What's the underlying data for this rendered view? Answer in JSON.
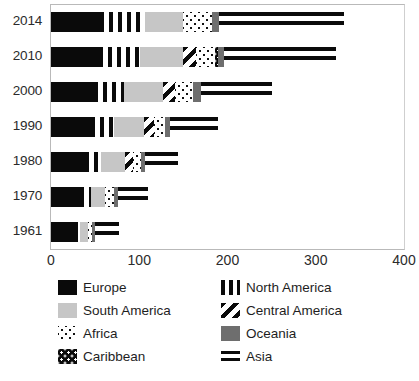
{
  "chart_data": {
    "type": "bar",
    "orientation": "horizontal",
    "stacked": true,
    "title": "",
    "xlabel": "",
    "ylabel": "",
    "xlim": [
      0,
      400
    ],
    "ylim": null,
    "grid": false,
    "legend_position": "bottom",
    "xticks": [
      "0",
      "100",
      "200",
      "300",
      "400"
    ],
    "xtick_values": [
      0,
      100,
      200,
      300,
      400
    ],
    "categories": [
      "2014",
      "2010",
      "2000",
      "1990",
      "1980",
      "1970",
      "1961"
    ],
    "series": [
      {
        "name": "Europe",
        "pattern": "solid-black",
        "color": "#0a0a0a",
        "values": [
          56,
          54,
          49,
          45,
          38,
          33,
          26
        ]
      },
      {
        "name": "North America",
        "pattern": "vertical-stripes",
        "color": "#0a0a0a",
        "values": [
          51,
          47,
          34,
          26,
          19,
          12,
          7
        ]
      },
      {
        "name": "South America",
        "pattern": "solid-lightgray",
        "color": "#c6c6c6",
        "values": [
          43,
          49,
          44,
          34,
          27,
          16,
          9
        ]
      },
      {
        "name": "Central America",
        "pattern": "diagonal-hatch",
        "color": "#0a0a0a",
        "values": [
          0,
          14,
          14,
          12,
          9,
          0,
          0
        ]
      },
      {
        "name": "Africa",
        "pattern": "dots-on-white",
        "color": "#111111",
        "values": [
          32,
          22,
          20,
          12,
          9,
          10,
          4
        ]
      },
      {
        "name": "Caribbean",
        "pattern": "dots-on-black",
        "color": "#0a0a0a",
        "values": [
          0,
          3,
          0,
          0,
          0,
          0,
          0
        ]
      },
      {
        "name": "Oceania",
        "pattern": "solid-gray",
        "color": "#6e6e6e",
        "values": [
          8,
          7,
          9,
          6,
          5,
          5,
          4
        ]
      },
      {
        "name": "Asia",
        "pattern": "horizontal-bands",
        "color": "#0a0a0a",
        "values": [
          142,
          127,
          80,
          54,
          37,
          34,
          27
        ]
      }
    ],
    "totals": [
      332,
      323,
      250,
      189,
      144,
      110,
      77
    ]
  },
  "legend": {
    "left_column": [
      {
        "label": "Europe",
        "swatch": "solid-black"
      },
      {
        "label": "South America",
        "swatch": "solid-lightgray"
      },
      {
        "label": "Africa",
        "swatch": "dots-on-white"
      },
      {
        "label": "Caribbean",
        "swatch": "dots-on-black"
      }
    ],
    "right_column": [
      {
        "label": "North America",
        "swatch": "vertical-stripes"
      },
      {
        "label": "Central America",
        "swatch": "diagonal-hatch"
      },
      {
        "label": "Oceania",
        "swatch": "solid-gray"
      },
      {
        "label": "Asia",
        "swatch": "horizontal-bands"
      }
    ]
  },
  "colors": {
    "europe": "#0a0a0a",
    "south_america": "#c6c6c6",
    "oceania": "#6e6e6e",
    "background": "#ffffff",
    "axis": "#b9b9b9",
    "text": "#1e1e1e"
  }
}
